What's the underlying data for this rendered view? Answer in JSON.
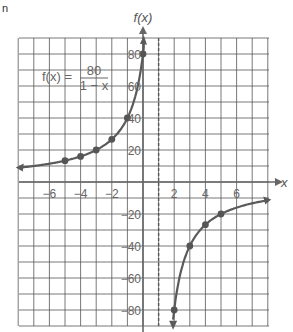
{
  "figure_label": "n",
  "chart_data": {
    "type": "line",
    "title": "",
    "equation": {
      "lhs": "f(x) =",
      "numerator": "80",
      "denominator": "1 − x"
    },
    "xlabel": "x",
    "ylabel": "f(x)",
    "xlim": [
      -8,
      8
    ],
    "ylim": [
      -95,
      95
    ],
    "grid": true,
    "x_grid_step": 1,
    "y_grid_step": 10,
    "x_ticks": [
      -6,
      -4,
      -2,
      2,
      4,
      6
    ],
    "x_tick_labels": [
      "−6",
      "−4",
      "−2",
      "2",
      "4",
      "6"
    ],
    "y_ticks": [
      80,
      60,
      40,
      20,
      -20,
      -40,
      -60,
      -80
    ],
    "y_tick_labels": [
      "80",
      "60",
      "40",
      "20",
      "−20",
      "−40",
      "−60",
      "−80"
    ],
    "asymptote_x": 1,
    "series": [
      {
        "name": "left branch",
        "x_range": [
          -7.9,
          0
        ],
        "points": [
          [
            -5,
            13.33
          ],
          [
            -4,
            16
          ],
          [
            -3,
            20
          ],
          [
            -2,
            26.67
          ],
          [
            -1,
            40
          ],
          [
            0,
            80
          ]
        ]
      },
      {
        "name": "right branch",
        "x_range": [
          2,
          8
        ],
        "points": [
          [
            2,
            -80
          ],
          [
            3,
            -40
          ],
          [
            4,
            -26.67
          ],
          [
            5,
            -20
          ]
        ]
      }
    ]
  }
}
